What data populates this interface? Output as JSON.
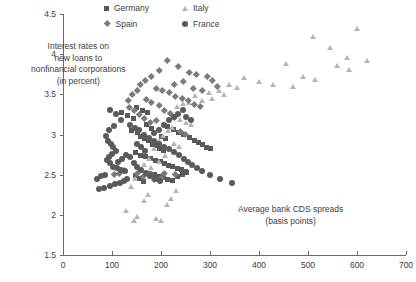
{
  "chart_data": {
    "type": "scatter",
    "title": "",
    "xlabel": "Average bank CDS spreads (basis points)",
    "ylabel": "Interest rates on new loans to nonfinancial corporations (in percent)",
    "xlim": [
      0,
      700
    ],
    "ylim": [
      1.5,
      4.5
    ],
    "xticks": [
      0,
      100,
      200,
      300,
      400,
      500,
      600,
      700
    ],
    "yticks": [
      1.5,
      2,
      2.5,
      3,
      3.5,
      4,
      4.5
    ],
    "xtick_labels": [
      "0",
      "100",
      "200",
      "300",
      "400",
      "500",
      "600",
      "700"
    ],
    "ytick_labels": [
      "1.5",
      "2",
      "2.5",
      "3",
      "3.5",
      "4",
      "4.5"
    ],
    "grid": false,
    "legend_position": "top-center",
    "annotations": [
      {
        "name": "y-axis-annotation",
        "lines": [
          "Interest rates on",
          "new loans to",
          "nonfinancial corporations",
          "(in percent)"
        ]
      },
      {
        "name": "x-axis-annotation",
        "lines": [
          "Average bank CDS spreads",
          "(basis points)"
        ]
      }
    ],
    "series": [
      {
        "name": "Germany",
        "marker": "square",
        "color": "#595959",
        "points": [
          [
            150,
            3.33
          ],
          [
            163,
            3.3
          ],
          [
            172,
            3.27
          ],
          [
            140,
            3.05
          ],
          [
            152,
            3.02
          ],
          [
            158,
            2.97
          ],
          [
            166,
            2.95
          ],
          [
            175,
            2.92
          ],
          [
            183,
            2.88
          ],
          [
            192,
            2.86
          ],
          [
            196,
            2.83
          ],
          [
            205,
            2.8
          ],
          [
            148,
            2.77
          ],
          [
            158,
            2.74
          ],
          [
            168,
            2.72
          ],
          [
            178,
            2.7
          ],
          [
            188,
            2.68
          ],
          [
            198,
            2.66
          ],
          [
            207,
            2.64
          ],
          [
            216,
            2.62
          ],
          [
            224,
            2.6
          ],
          [
            233,
            2.58
          ],
          [
            241,
            2.56
          ],
          [
            250,
            2.54
          ],
          [
            176,
            2.52
          ],
          [
            186,
            2.5
          ],
          [
            196,
            2.48
          ],
          [
            205,
            2.46
          ],
          [
            214,
            2.44
          ],
          [
            224,
            2.43
          ],
          [
            234,
            2.48
          ],
          [
            243,
            2.5
          ],
          [
            252,
            2.53
          ],
          [
            120,
            3.28
          ],
          [
            131,
            3.24
          ],
          [
            144,
            3.2
          ],
          [
            214,
            3.1
          ],
          [
            225,
            3.06
          ],
          [
            236,
            3.03
          ],
          [
            246,
            3.0
          ],
          [
            200,
            2.98
          ],
          [
            210,
            2.95
          ],
          [
            187,
            2.9
          ],
          [
            170,
            3.12
          ],
          [
            181,
            3.08
          ],
          [
            258,
            2.96
          ],
          [
            268,
            2.93
          ],
          [
            276,
            2.9
          ],
          [
            284,
            2.87
          ],
          [
            292,
            2.84
          ],
          [
            300,
            2.82
          ],
          [
            164,
            2.41
          ],
          [
            156,
            2.45
          ],
          [
            147,
            2.49
          ]
        ]
      },
      {
        "name": "Italy",
        "marker": "triangle",
        "color": "#b4b4b4",
        "points": [
          [
            510,
            4.22
          ],
          [
            600,
            4.31
          ],
          [
            545,
            4.08
          ],
          [
            580,
            3.95
          ],
          [
            620,
            3.92
          ],
          [
            560,
            3.85
          ],
          [
            585,
            3.8
          ],
          [
            455,
            3.88
          ],
          [
            490,
            3.72
          ],
          [
            515,
            3.68
          ],
          [
            430,
            3.62
          ],
          [
            470,
            3.6
          ],
          [
            400,
            3.65
          ],
          [
            370,
            3.7
          ],
          [
            340,
            3.62
          ],
          [
            355,
            3.58
          ],
          [
            318,
            3.55
          ],
          [
            330,
            3.5
          ],
          [
            298,
            3.52
          ],
          [
            305,
            3.45
          ],
          [
            270,
            3.48
          ],
          [
            285,
            3.42
          ],
          [
            258,
            3.4
          ],
          [
            246,
            3.38
          ],
          [
            234,
            3.35
          ],
          [
            240,
            3.18
          ],
          [
            252,
            3.15
          ],
          [
            262,
            3.12
          ],
          [
            224,
            3.08
          ],
          [
            214,
            3.05
          ],
          [
            205,
            2.98
          ],
          [
            196,
            2.92
          ],
          [
            228,
            2.88
          ],
          [
            238,
            2.85
          ],
          [
            186,
            2.82
          ],
          [
            176,
            2.7
          ],
          [
            166,
            2.62
          ],
          [
            158,
            2.55
          ],
          [
            148,
            2.45
          ],
          [
            140,
            2.35
          ],
          [
            175,
            2.25
          ],
          [
            166,
            2.18
          ],
          [
            130,
            2.05
          ],
          [
            152,
            1.98
          ],
          [
            190,
            1.95
          ],
          [
            200,
            1.93
          ],
          [
            145,
            1.92
          ],
          [
            212,
            2.12
          ],
          [
            222,
            2.2
          ],
          [
            232,
            2.3
          ],
          [
            180,
            2.58
          ],
          [
            196,
            2.66
          ],
          [
            208,
            2.74
          ]
        ]
      },
      {
        "name": "Spain",
        "marker": "diamond",
        "color": "#7b7b7b",
        "points": [
          [
            212,
            3.92
          ],
          [
            236,
            3.85
          ],
          [
            196,
            3.8
          ],
          [
            258,
            3.78
          ],
          [
            272,
            3.75
          ],
          [
            295,
            3.72
          ],
          [
            305,
            3.68
          ],
          [
            246,
            3.66
          ],
          [
            228,
            3.62
          ],
          [
            265,
            3.58
          ],
          [
            285,
            3.55
          ],
          [
            315,
            3.6
          ],
          [
            180,
            3.72
          ],
          [
            168,
            3.68
          ],
          [
            158,
            3.62
          ],
          [
            190,
            3.58
          ],
          [
            202,
            3.55
          ],
          [
            216,
            3.52
          ],
          [
            230,
            3.48
          ],
          [
            244,
            3.45
          ],
          [
            152,
            3.55
          ],
          [
            142,
            3.5
          ],
          [
            256,
            3.42
          ],
          [
            268,
            3.38
          ],
          [
            280,
            3.35
          ],
          [
            170,
            3.44
          ],
          [
            180,
            3.4
          ],
          [
            196,
            3.36
          ],
          [
            134,
            3.42
          ],
          [
            206,
            3.3
          ],
          [
            218,
            3.26
          ],
          [
            228,
            3.22
          ],
          [
            190,
            3.18
          ],
          [
            178,
            3.15
          ],
          [
            166,
            3.2
          ],
          [
            156,
            3.25
          ],
          [
            146,
            3.3
          ],
          [
            136,
            3.34
          ],
          [
            126,
            2.55
          ],
          [
            114,
            2.52
          ],
          [
            105,
            2.5
          ],
          [
            152,
            2.52
          ],
          [
            164,
            2.48
          ],
          [
            178,
            2.5
          ],
          [
            206,
            2.52
          ],
          [
            230,
            2.5
          ],
          [
            200,
            2.45
          ],
          [
            186,
            2.44
          ],
          [
            240,
            3.04
          ],
          [
            250,
            3.0
          ]
        ]
      },
      {
        "name": "France",
        "marker": "circle",
        "color": "#5a5a5a",
        "points": [
          [
            96,
            3.3
          ],
          [
            108,
            3.25
          ],
          [
            118,
            3.18
          ],
          [
            104,
            3.1
          ],
          [
            94,
            3.05
          ],
          [
            88,
            2.98
          ],
          [
            92,
            2.92
          ],
          [
            98,
            2.88
          ],
          [
            103,
            2.84
          ],
          [
            108,
            2.8
          ],
          [
            100,
            2.76
          ],
          [
            94,
            2.72
          ],
          [
            90,
            2.68
          ],
          [
            96,
            2.64
          ],
          [
            102,
            2.6
          ],
          [
            110,
            2.58
          ],
          [
            118,
            2.56
          ],
          [
            126,
            2.54
          ],
          [
            86,
            2.5
          ],
          [
            78,
            2.48
          ],
          [
            70,
            2.45
          ],
          [
            112,
            2.66
          ],
          [
            120,
            2.7
          ],
          [
            128,
            2.74
          ],
          [
            136,
            2.72
          ],
          [
            130,
            2.45
          ],
          [
            124,
            2.42
          ],
          [
            116,
            2.4
          ],
          [
            106,
            2.38
          ],
          [
            96,
            2.36
          ],
          [
            84,
            2.34
          ],
          [
            74,
            2.32
          ],
          [
            136,
            3.12
          ],
          [
            146,
            3.08
          ],
          [
            156,
            3.05
          ],
          [
            166,
            3.0
          ],
          [
            176,
            2.96
          ],
          [
            186,
            2.92
          ],
          [
            196,
            2.88
          ],
          [
            206,
            2.85
          ],
          [
            216,
            2.82
          ],
          [
            226,
            2.78
          ],
          [
            236,
            2.74
          ],
          [
            246,
            2.7
          ],
          [
            256,
            2.66
          ],
          [
            264,
            2.62
          ],
          [
            274,
            2.58
          ],
          [
            284,
            2.55
          ],
          [
            300,
            2.5
          ],
          [
            320,
            2.44
          ],
          [
            186,
            3.02
          ],
          [
            196,
            3.06
          ],
          [
            206,
            3.12
          ],
          [
            216,
            3.18
          ],
          [
            226,
            3.22
          ],
          [
            234,
            3.26
          ],
          [
            244,
            3.3
          ],
          [
            252,
            3.22
          ],
          [
            262,
            3.18
          ],
          [
            152,
            2.88
          ],
          [
            160,
            2.84
          ],
          [
            168,
            2.8
          ],
          [
            144,
            2.64
          ],
          [
            152,
            2.6
          ],
          [
            160,
            2.56
          ],
          [
            170,
            2.52
          ],
          [
            178,
            2.48
          ],
          [
            188,
            2.44
          ],
          [
            198,
            2.42
          ],
          [
            345,
            2.4
          ]
        ]
      }
    ]
  },
  "legend": {
    "entries": [
      {
        "label": "Germany",
        "marker": "square"
      },
      {
        "label": "Italy",
        "marker": "triangle"
      },
      {
        "label": "Spain",
        "marker": "diamond"
      },
      {
        "label": "France",
        "marker": "circle"
      }
    ]
  }
}
